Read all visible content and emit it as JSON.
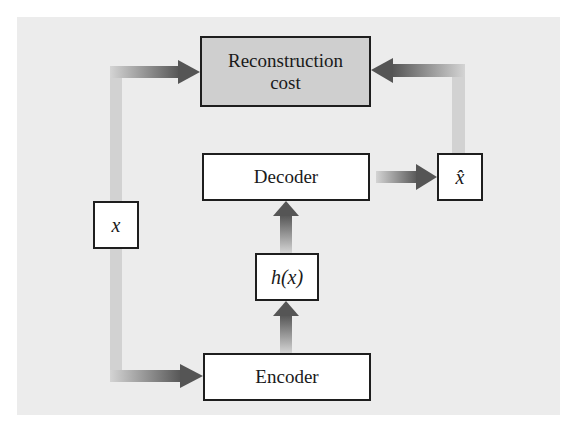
{
  "diagram": {
    "type": "autoencoder-schematic",
    "nodes": {
      "reconstruction_cost": "Reconstruction cost",
      "decoder": "Decoder",
      "encoder": "Encoder",
      "input": "x",
      "code": "h(x)",
      "reconstruction": "x̂"
    },
    "edges": [
      {
        "from": "input",
        "to": "reconstruction_cost"
      },
      {
        "from": "input",
        "to": "encoder"
      },
      {
        "from": "encoder",
        "to": "code"
      },
      {
        "from": "code",
        "to": "decoder"
      },
      {
        "from": "decoder",
        "to": "reconstruction"
      },
      {
        "from": "reconstruction",
        "to": "reconstruction_cost"
      }
    ],
    "colors": {
      "panel": "#ececec",
      "cost_box": "#cfcfcf",
      "box": "#ffffff",
      "arrow_dark": "#555555",
      "arrow_light": "#d0d0d0"
    }
  }
}
